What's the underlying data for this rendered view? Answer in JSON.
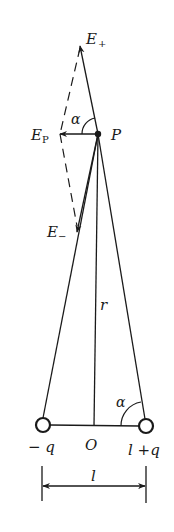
{
  "diagram": {
    "colors": {
      "ink": "#1a1a1a",
      "background": "#ffffff"
    },
    "labels": {
      "e_plus_main": "E",
      "e_plus_sub": "+",
      "e_p_main": "E",
      "e_p_sub": "P",
      "e_minus_main": "E",
      "e_minus_sub": "−",
      "alpha_top": "α",
      "point_p": "P",
      "r": "r",
      "alpha_bottom": "α",
      "neg_charge": "− q",
      "origin": "O",
      "pos_charge": "l +q",
      "length": "l"
    },
    "points": {
      "P": [
        98,
        134
      ],
      "E_plus_tip": [
        80,
        45
      ],
      "E_minus_tip": [
        77,
        228
      ],
      "E_P_tip": [
        60,
        134
      ],
      "neg_charge": [
        43,
        425
      ],
      "pos_charge": [
        146,
        426
      ],
      "O": [
        94,
        426
      ]
    }
  }
}
